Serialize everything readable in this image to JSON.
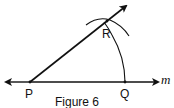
{
  "figure": {
    "caption": "Figure 6",
    "points": {
      "P": "P",
      "Q": "Q",
      "R": "R"
    },
    "line_label": "m"
  }
}
